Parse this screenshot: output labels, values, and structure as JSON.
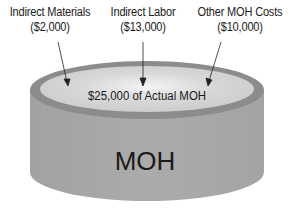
{
  "labels": [
    {
      "name": "Indirect Materials",
      "amount": "($2,000)"
    },
    {
      "name": "Indirect Labor",
      "amount": "($13,000)"
    },
    {
      "name": "Other MOH Costs",
      "amount": "($10,000)"
    }
  ],
  "container": {
    "top_text": "$25,000 of Actual MOH",
    "body_text": "MOH"
  },
  "colors": {
    "side": "#a9a9a9",
    "rim": "#8c8c8c",
    "inner": "#d4d4d4",
    "text": "#1a1a1a"
  }
}
